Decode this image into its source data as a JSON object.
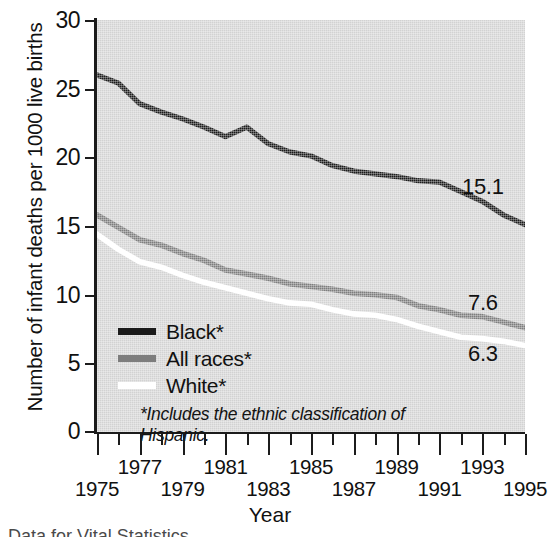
{
  "chart_data": {
    "type": "line",
    "title": "",
    "xlabel": "Year",
    "ylabel": "Number of infant deaths per 1000 live births",
    "xlim": [
      1975,
      1995
    ],
    "ylim": [
      0,
      30
    ],
    "yticks": [
      0,
      5,
      10,
      15,
      20,
      25,
      30
    ],
    "xticks": [
      1975,
      1976,
      1977,
      1978,
      1979,
      1980,
      1981,
      1982,
      1983,
      1984,
      1985,
      1986,
      1987,
      1988,
      1989,
      1990,
      1991,
      1992,
      1993,
      1994,
      1995
    ],
    "xtick_labels_upper": [
      "1977",
      "1981",
      "1985",
      "1989",
      "1993"
    ],
    "xtick_labels_lower": [
      "1975",
      "1979",
      "1983",
      "1987",
      "1991",
      "1995"
    ],
    "grid": false,
    "legend_position": "inside-lower-left",
    "x": [
      1975,
      1976,
      1977,
      1978,
      1979,
      1980,
      1981,
      1982,
      1983,
      1984,
      1985,
      1986,
      1987,
      1988,
      1989,
      1990,
      1991,
      1992,
      1993,
      1994,
      1995
    ],
    "series": [
      {
        "name": "Black*",
        "color": "#1b1b1b",
        "end_label": "15.1",
        "values": [
          26.0,
          25.4,
          23.9,
          23.3,
          22.8,
          22.2,
          21.5,
          22.2,
          21.0,
          20.4,
          20.1,
          19.4,
          19.0,
          18.8,
          18.6,
          18.3,
          18.2,
          17.5,
          16.8,
          15.8,
          15.1
        ]
      },
      {
        "name": "All races*",
        "color": "#7d7d7d",
        "end_label": "7.6",
        "values": [
          15.8,
          14.9,
          14.0,
          13.6,
          13.0,
          12.5,
          11.8,
          11.5,
          11.2,
          10.8,
          10.6,
          10.4,
          10.1,
          10.0,
          9.8,
          9.2,
          8.9,
          8.5,
          8.4,
          8.0,
          7.6
        ]
      },
      {
        "name": "White*",
        "color": "#ffffff",
        "end_label": "6.3",
        "values": [
          14.4,
          13.3,
          12.4,
          12.0,
          11.4,
          10.9,
          10.5,
          10.1,
          9.7,
          9.4,
          9.3,
          8.9,
          8.6,
          8.5,
          8.2,
          7.7,
          7.3,
          6.9,
          6.8,
          6.6,
          6.3
        ]
      }
    ],
    "footnote": "*Includes the ethnic classification of Hispanic."
  },
  "legend": {
    "items": [
      {
        "label": "Black*",
        "swatch": "swatch-black"
      },
      {
        "label": "All races*",
        "swatch": "swatch-gray"
      },
      {
        "label": "White*",
        "swatch": "swatch-white"
      }
    ],
    "note": "*Includes the ethnic classification of Hispanic."
  },
  "axes": {
    "y_title": "Number of infant deaths per 1000 live births",
    "x_title": "Year",
    "y_labels": [
      "30",
      "25",
      "20",
      "15",
      "10",
      "5",
      "0"
    ],
    "x_labels_upper": [
      "1977",
      "1981",
      "1985",
      "1989",
      "1993"
    ],
    "x_labels_lower": [
      "1975",
      "1979",
      "1983",
      "1987",
      "1991",
      "1995"
    ]
  },
  "end_labels": {
    "black": "15.1",
    "all_races": "7.6",
    "white": "6.3"
  },
  "caption": {
    "clipped_text": "Data for Vital Statistics"
  }
}
